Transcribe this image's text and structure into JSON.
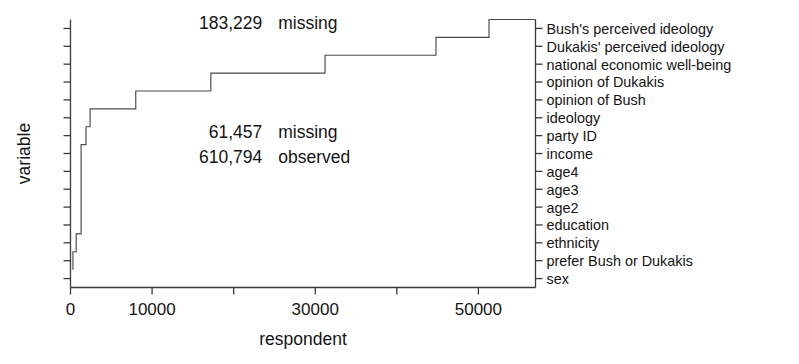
{
  "chart_data": {
    "type": "line",
    "subtype": "step",
    "title": "",
    "xlabel": "respondent",
    "ylabel": "variable",
    "xlim": [
      0,
      57000
    ],
    "ylim": [
      0,
      15
    ],
    "grid": false,
    "legend": null,
    "x_ticks": [
      {
        "value": 0,
        "label": "0"
      },
      {
        "value": 10000,
        "label": "10000"
      },
      {
        "value": 20000,
        "label": ""
      },
      {
        "value": 30000,
        "label": "30000"
      },
      {
        "value": 40000,
        "label": ""
      },
      {
        "value": 50000,
        "label": "50000"
      }
    ],
    "y_categories": [
      "sex",
      "prefer Bush or Dukakis",
      "ethnicity",
      "education",
      "age2",
      "age3",
      "age4",
      "income",
      "party ID",
      "ideology",
      "opinion of Bush",
      "opinion of Dukakis",
      "national economic well-being",
      "Dukakis' perceived ideology",
      "Bush's perceived ideology"
    ],
    "step_points": [
      {
        "x": 300,
        "y": 1
      },
      {
        "x": 300,
        "y": 2
      },
      {
        "x": 700,
        "y": 2
      },
      {
        "x": 700,
        "y": 3
      },
      {
        "x": 1300,
        "y": 3
      },
      {
        "x": 1300,
        "y": 8
      },
      {
        "x": 1900,
        "y": 8
      },
      {
        "x": 1900,
        "y": 9
      },
      {
        "x": 2400,
        "y": 9
      },
      {
        "x": 2400,
        "y": 10
      },
      {
        "x": 8000,
        "y": 10
      },
      {
        "x": 8000,
        "y": 11
      },
      {
        "x": 17200,
        "y": 11
      },
      {
        "x": 17200,
        "y": 12
      },
      {
        "x": 31200,
        "y": 12
      },
      {
        "x": 31200,
        "y": 13
      },
      {
        "x": 44800,
        "y": 13
      },
      {
        "x": 44800,
        "y": 14
      },
      {
        "x": 51300,
        "y": 14
      },
      {
        "x": 51300,
        "y": 15
      },
      {
        "x": 57000,
        "y": 15
      }
    ],
    "annotations": [
      {
        "id": "missing-upper",
        "number": "183,229",
        "word": "missing",
        "x": 23500,
        "y_level": 14.45
      },
      {
        "id": "missing-lower",
        "number": "61,457",
        "word": "missing",
        "x": 23500,
        "y_level": 8.35
      },
      {
        "id": "observed",
        "number": "610,794",
        "word": "observed",
        "x": 23500,
        "y_level": 6.95
      }
    ]
  },
  "colors": {
    "axis": "#3a3a3a",
    "line": "#4a4a4a",
    "text": "#141414",
    "background": "#ffffff"
  }
}
